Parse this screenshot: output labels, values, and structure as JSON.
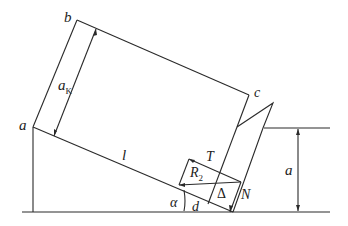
{
  "diagram": {
    "type": "mechanics-free-body",
    "colors": {
      "line": "#2a2a2a",
      "background": "#ffffff"
    },
    "labels": {
      "corner_b": "b",
      "corner_c": "c",
      "corner_a": "a",
      "width_ak": "a",
      "width_ak_sub": "K",
      "length_l": "l",
      "force_T": "T",
      "force_R": "R",
      "force_R_sub": "2",
      "delta": "Δ",
      "force_N": "N",
      "angle_alpha": "α",
      "distance_d": "d",
      "height_a": "a"
    }
  }
}
